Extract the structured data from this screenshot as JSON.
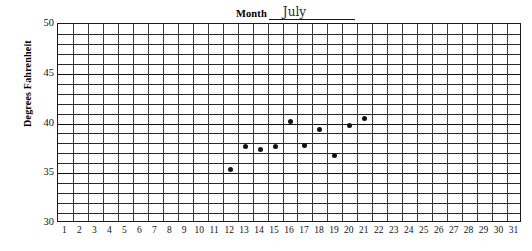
{
  "title": {
    "label": "Month",
    "value": "July"
  },
  "axes": {
    "y_title": "Degrees Fahrenheit",
    "y_ticks": [
      30,
      35,
      40,
      45,
      50
    ],
    "y_min": 30,
    "y_max": 50,
    "x_ticks": [
      1,
      2,
      3,
      4,
      5,
      6,
      7,
      8,
      9,
      10,
      11,
      12,
      13,
      14,
      15,
      16,
      17,
      18,
      19,
      20,
      21,
      22,
      23,
      24,
      25,
      26,
      27,
      28,
      29,
      30,
      31
    ],
    "x_min": 1,
    "x_max": 31
  },
  "chart_data": {
    "type": "scatter",
    "title": "Month July",
    "xlabel": "",
    "ylabel": "Degrees Fahrenheit",
    "xlim": [
      1,
      31
    ],
    "ylim": [
      30,
      50
    ],
    "grid": true,
    "legend": "none",
    "x": [
      12,
      13,
      14,
      15,
      16,
      17,
      18,
      19,
      20,
      21
    ],
    "values": [
      35.4,
      37.7,
      37.4,
      37.7,
      40.2,
      37.8,
      39.4,
      36.8,
      39.8,
      40.5
    ],
    "categories": [
      "12",
      "13",
      "14",
      "15",
      "16",
      "17",
      "18",
      "19",
      "20",
      "21"
    ],
    "point_color": "#111111",
    "grid_color": "#2a2a2a",
    "y_gridline_step": 1,
    "y_major_step": 5
  }
}
